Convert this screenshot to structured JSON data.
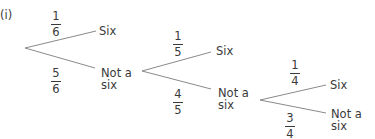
{
  "diagram": {
    "label": "(i)",
    "type": "probability-tree",
    "line_color": "#8a8a8a",
    "text_color": "#3a3a3a",
    "stages": [
      {
        "upper": {
          "numerator": "1",
          "denominator": "6",
          "outcome": "Six"
        },
        "lower": {
          "numerator": "5",
          "denominator": "6",
          "outcome_line1": "Not a",
          "outcome_line2": "six"
        }
      },
      {
        "upper": {
          "numerator": "1",
          "denominator": "5",
          "outcome": "Six"
        },
        "lower": {
          "numerator": "4",
          "denominator": "5",
          "outcome_line1": "Not a",
          "outcome_line2": "six"
        }
      },
      {
        "upper": {
          "numerator": "1",
          "denominator": "4",
          "outcome": "Six"
        },
        "lower": {
          "numerator": "3",
          "denominator": "4",
          "outcome_line1": "Not a",
          "outcome_line2": "six"
        }
      }
    ]
  }
}
